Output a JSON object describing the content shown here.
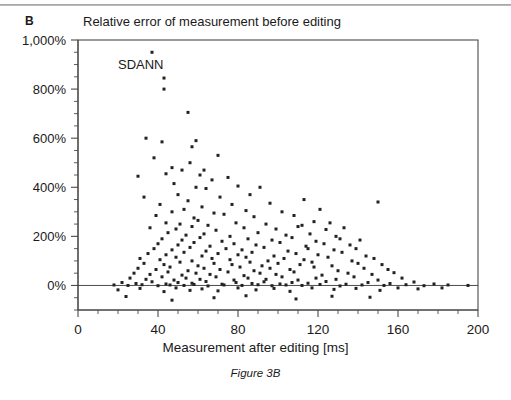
{
  "panel": {
    "label": "B"
  },
  "title": "Relative error of measurement before editing",
  "caption": "Figure 3B",
  "colors": {
    "ink": "#1a1a1a",
    "axis": "#333333",
    "marker": "#222222",
    "background": "#ffffff"
  },
  "chart_data": {
    "type": "scatter",
    "title": "Relative error of measurement before editing",
    "xlabel": "Measurement after editing [ms]",
    "ylabel": "",
    "xlim": [
      0,
      200
    ],
    "ylim": [
      -100,
      1000
    ],
    "xticks": [
      0,
      40,
      80,
      120,
      160,
      200
    ],
    "xtick_labels": [
      "0",
      "40",
      "80",
      "120",
      "160",
      "200"
    ],
    "x_minor_step": 10,
    "yticks": [
      0,
      200,
      400,
      600,
      800,
      1000
    ],
    "ytick_labels": [
      "0%",
      "200%",
      "400%",
      "600%",
      "800%",
      "1,000%"
    ],
    "y_minor_step": 50,
    "grid": false,
    "legend": null,
    "annotations": [
      {
        "text": "SDANN",
        "x": 20,
        "y": 880
      }
    ],
    "marker": {
      "shape": "square",
      "size": 3,
      "color": "#222222"
    },
    "points": [
      [
        37,
        950
      ],
      [
        43,
        845
      ],
      [
        43,
        800
      ],
      [
        55,
        705
      ],
      [
        34,
        600
      ],
      [
        42,
        585
      ],
      [
        57,
        565
      ],
      [
        59,
        590
      ],
      [
        38,
        520
      ],
      [
        47,
        480
      ],
      [
        52,
        470
      ],
      [
        56,
        500
      ],
      [
        63,
        470
      ],
      [
        70,
        530
      ],
      [
        30,
        445
      ],
      [
        44,
        455
      ],
      [
        61,
        450
      ],
      [
        67,
        430
      ],
      [
        75,
        440
      ],
      [
        48,
        415
      ],
      [
        59,
        400
      ],
      [
        64,
        395
      ],
      [
        80,
        405
      ],
      [
        91,
        400
      ],
      [
        33,
        360
      ],
      [
        50,
        370
      ],
      [
        71,
        360
      ],
      [
        86,
        370
      ],
      [
        150,
        340
      ],
      [
        41,
        330
      ],
      [
        55,
        345
      ],
      [
        62,
        320
      ],
      [
        77,
        330
      ],
      [
        96,
        335
      ],
      [
        113,
        350
      ],
      [
        47,
        300
      ],
      [
        53,
        310
      ],
      [
        68,
        295
      ],
      [
        84,
        305
      ],
      [
        102,
        300
      ],
      [
        121,
        310
      ],
      [
        39,
        285
      ],
      [
        58,
        275
      ],
      [
        73,
        290
      ],
      [
        88,
        280
      ],
      [
        108,
        285
      ],
      [
        118,
        260
      ],
      [
        44,
        255
      ],
      [
        51,
        250
      ],
      [
        60,
        265
      ],
      [
        65,
        245
      ],
      [
        79,
        255
      ],
      [
        94,
        250
      ],
      [
        112,
        245
      ],
      [
        126,
        255
      ],
      [
        36,
        235
      ],
      [
        49,
        230
      ],
      [
        57,
        240
      ],
      [
        69,
        225
      ],
      [
        83,
        235
      ],
      [
        99,
        230
      ],
      [
        110,
        240
      ],
      [
        124,
        228
      ],
      [
        133,
        235
      ],
      [
        45,
        215
      ],
      [
        54,
        205
      ],
      [
        63,
        210
      ],
      [
        76,
        200
      ],
      [
        90,
        215
      ],
      [
        104,
        205
      ],
      [
        116,
        210
      ],
      [
        129,
        200
      ],
      [
        42,
        190
      ],
      [
        52,
        185
      ],
      [
        61,
        195
      ],
      [
        72,
        180
      ],
      [
        85,
        190
      ],
      [
        97,
        185
      ],
      [
        107,
        195
      ],
      [
        119,
        180
      ],
      [
        131,
        190
      ],
      [
        141,
        185
      ],
      [
        40,
        170
      ],
      [
        50,
        165
      ],
      [
        58,
        175
      ],
      [
        66,
        160
      ],
      [
        78,
        170
      ],
      [
        89,
        165
      ],
      [
        101,
        175
      ],
      [
        114,
        160
      ],
      [
        123,
        170
      ],
      [
        136,
        165
      ],
      [
        38,
        150
      ],
      [
        47,
        145
      ],
      [
        56,
        155
      ],
      [
        64,
        140
      ],
      [
        74,
        150
      ],
      [
        82,
        145
      ],
      [
        93,
        155
      ],
      [
        105,
        140
      ],
      [
        115,
        150
      ],
      [
        128,
        145
      ],
      [
        139,
        150
      ],
      [
        35,
        130
      ],
      [
        44,
        125
      ],
      [
        53,
        135
      ],
      [
        62,
        120
      ],
      [
        70,
        130
      ],
      [
        80,
        125
      ],
      [
        87,
        135
      ],
      [
        98,
        120
      ],
      [
        109,
        130
      ],
      [
        120,
        125
      ],
      [
        132,
        135
      ],
      [
        144,
        120
      ],
      [
        31,
        110
      ],
      [
        41,
        105
      ],
      [
        49,
        115
      ],
      [
        57,
        100
      ],
      [
        67,
        110
      ],
      [
        76,
        105
      ],
      [
        84,
        115
      ],
      [
        95,
        100
      ],
      [
        103,
        110
      ],
      [
        113,
        105
      ],
      [
        125,
        115
      ],
      [
        137,
        100
      ],
      [
        148,
        110
      ],
      [
        33,
        90
      ],
      [
        43,
        85
      ],
      [
        51,
        95
      ],
      [
        60,
        80
      ],
      [
        68,
        90
      ],
      [
        77,
        85
      ],
      [
        86,
        95
      ],
      [
        92,
        80
      ],
      [
        100,
        90
      ],
      [
        111,
        85
      ],
      [
        117,
        95
      ],
      [
        127,
        80
      ],
      [
        140,
        90
      ],
      [
        152,
        85
      ],
      [
        30,
        70
      ],
      [
        39,
        65
      ],
      [
        46,
        75
      ],
      [
        55,
        60
      ],
      [
        63,
        70
      ],
      [
        71,
        65
      ],
      [
        81,
        75
      ],
      [
        88,
        60
      ],
      [
        96,
        70
      ],
      [
        106,
        65
      ],
      [
        118,
        75
      ],
      [
        130,
        60
      ],
      [
        143,
        70
      ],
      [
        155,
        65
      ],
      [
        28,
        50
      ],
      [
        36,
        45
      ],
      [
        45,
        55
      ],
      [
        52,
        42
      ],
      [
        59,
        50
      ],
      [
        66,
        45
      ],
      [
        75,
        55
      ],
      [
        83,
        40
      ],
      [
        91,
        50
      ],
      [
        99,
        45
      ],
      [
        108,
        55
      ],
      [
        122,
        42
      ],
      [
        135,
        50
      ],
      [
        147,
        45
      ],
      [
        158,
        52
      ],
      [
        26,
        30
      ],
      [
        34,
        25
      ],
      [
        42,
        35
      ],
      [
        48,
        22
      ],
      [
        54,
        30
      ],
      [
        61,
        25
      ],
      [
        69,
        35
      ],
      [
        78,
        22
      ],
      [
        85,
        30
      ],
      [
        94,
        25
      ],
      [
        102,
        35
      ],
      [
        110,
        22
      ],
      [
        119,
        30
      ],
      [
        129,
        25
      ],
      [
        138,
        35
      ],
      [
        150,
        22
      ],
      [
        162,
        30
      ],
      [
        22,
        12
      ],
      [
        29,
        8
      ],
      [
        37,
        15
      ],
      [
        44,
        6
      ],
      [
        50,
        12
      ],
      [
        57,
        9
      ],
      [
        64,
        16
      ],
      [
        72,
        5
      ],
      [
        79,
        12
      ],
      [
        87,
        8
      ],
      [
        93,
        15
      ],
      [
        101,
        6
      ],
      [
        107,
        12
      ],
      [
        115,
        9
      ],
      [
        124,
        16
      ],
      [
        134,
        5
      ],
      [
        145,
        12
      ],
      [
        156,
        8
      ],
      [
        168,
        14
      ],
      [
        178,
        6
      ],
      [
        18,
        2
      ],
      [
        25,
        0
      ],
      [
        32,
        3
      ],
      [
        40,
        -1
      ],
      [
        46,
        2
      ],
      [
        53,
        0
      ],
      [
        58,
        4
      ],
      [
        65,
        -2
      ],
      [
        73,
        2
      ],
      [
        82,
        0
      ],
      [
        90,
        3
      ],
      [
        97,
        -1
      ],
      [
        104,
        2
      ],
      [
        112,
        0
      ],
      [
        121,
        4
      ],
      [
        131,
        -2
      ],
      [
        142,
        2
      ],
      [
        153,
        0
      ],
      [
        164,
        3
      ],
      [
        173,
        -1
      ],
      [
        185,
        2
      ],
      [
        195,
        0
      ],
      [
        20,
        -18
      ],
      [
        31,
        -12
      ],
      [
        43,
        -25
      ],
      [
        49,
        -10
      ],
      [
        56,
        -20
      ],
      [
        62,
        -14
      ],
      [
        70,
        -22
      ],
      [
        80,
        -10
      ],
      [
        89,
        -18
      ],
      [
        98,
        -12
      ],
      [
        106,
        -24
      ],
      [
        117,
        -10
      ],
      [
        128,
        -16
      ],
      [
        139,
        -12
      ],
      [
        151,
        -20
      ],
      [
        160,
        -10
      ],
      [
        170,
        -14
      ],
      [
        182,
        -10
      ],
      [
        24,
        -45
      ],
      [
        47,
        -60
      ],
      [
        68,
        -50
      ],
      [
        84,
        -42
      ],
      [
        109,
        -55
      ],
      [
        127,
        -44
      ],
      [
        146,
        -48
      ]
    ]
  }
}
